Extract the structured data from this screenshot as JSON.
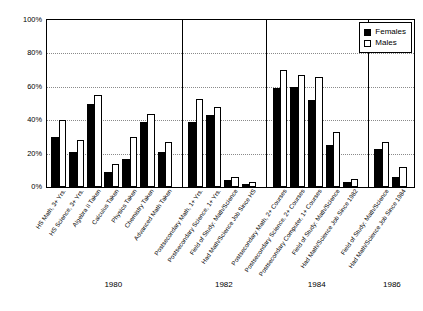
{
  "chart_data": {
    "type": "bar",
    "title": "",
    "xlabel": "",
    "ylabel": "",
    "ylim": [
      0,
      100
    ],
    "ytick_labels": [
      "0%",
      "20%",
      "40%",
      "60%",
      "80%",
      "100%"
    ],
    "ytick_values": [
      0,
      20,
      40,
      60,
      80,
      100
    ],
    "grid": true,
    "legend_position": "top-right",
    "legend": [
      "Females",
      "Males"
    ],
    "series": [
      {
        "name": "Females",
        "color": "#000000",
        "values": [
          30,
          21,
          50,
          9,
          17,
          39,
          21,
          39,
          43,
          4,
          2,
          59,
          60,
          52,
          25,
          3,
          23,
          6
        ]
      },
      {
        "name": "Males",
        "color": "#ffffff",
        "values": [
          40,
          28,
          55,
          14,
          30,
          44,
          27,
          53,
          48,
          6,
          3,
          70,
          67,
          66,
          33,
          5,
          27,
          12
        ]
      }
    ],
    "categories": [
      "HS Math, 3+ Yrs.",
      "HS Science, 3+ Yrs.",
      "Algebra II Taken",
      "Calculus Taken",
      "Physics Taken",
      "Chemistry Taken",
      "Advanced Math Taken",
      "Postsecondary Math, 1+ Yrs.",
      "Postsecondary Science, 1+ Yrs.",
      "Field of Study: Math/Science",
      "Had Math/Science Job Since HS",
      "Postsecondary Math, 2+ Courses",
      "Postsecondary Science, 2+ Courses",
      "Postsecondary Computer, 1+ Courses",
      "Field of Study: Math/Science",
      "Had Math/Science Job Since 1982",
      "Field of Study: Math/Science",
      "Had Math/Science Job Since 1984"
    ],
    "groups": [
      {
        "year": "1980",
        "start": 0,
        "count": 7
      },
      {
        "year": "1982",
        "start": 7,
        "count": 4
      },
      {
        "year": "1984",
        "start": 11,
        "count": 5
      },
      {
        "year": "1986",
        "start": 16,
        "count": 2
      }
    ]
  },
  "legend": {
    "females_label": "Females",
    "males_label": "Males"
  },
  "colors": {
    "females": "#000000",
    "males": "#ffffff",
    "axis": "#000000",
    "grid": "#8a8a8a",
    "background": "#ffffff"
  }
}
